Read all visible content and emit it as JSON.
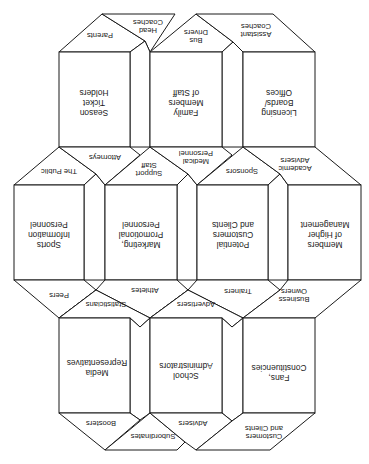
{
  "diagram": {
    "orientation": "rotated-180",
    "cubes": {
      "top_left": {
        "face": [
          "Season",
          "Ticket",
          "Holders"
        ],
        "roof": [
          "Parents"
        ],
        "roof_side": [
          "Head",
          "Coaches"
        ]
      },
      "top_middle": {
        "face": [
          "Family",
          "Members",
          "of Staff"
        ],
        "roof": [
          "Bus",
          "Drivers"
        ]
      },
      "top_right": {
        "face": [
          "Licensing",
          "Boards/",
          "Offices"
        ],
        "roof": [
          "Assistant",
          "Coaches"
        ]
      },
      "mid_1": {
        "face": [
          "Sports",
          "Information",
          "Personnel"
        ],
        "roof": [
          "The Public"
        ],
        "floor": [
          "Peers"
        ]
      },
      "mid_2": {
        "face": [
          "Marketing,",
          "Promotional",
          "Personnel"
        ],
        "roof": [
          "Support",
          "Staff"
        ],
        "roof_side": [
          "Attorneys"
        ],
        "floor": [
          "Athletes"
        ]
      },
      "mid_3": {
        "face": [
          "Potential",
          "Customers",
          "and Clients"
        ],
        "roof": [
          "Sponsors"
        ],
        "roof_side": [
          "Medical",
          "Personnel"
        ],
        "floor": [
          "Trainers"
        ]
      },
      "mid_4": {
        "face": [
          "Members",
          "of Higher",
          "Management"
        ],
        "roof": [
          "Academic",
          "Advisers"
        ],
        "floor": [
          "Business",
          "Owners"
        ]
      },
      "bottom_left": {
        "face": [
          "Media",
          "Representatives"
        ],
        "roof": [
          "Statisticians"
        ],
        "floor": [
          "Boosters"
        ],
        "floor_side": [
          "Subordinates"
        ]
      },
      "bottom_middle": {
        "face": [
          "School",
          "Administrators"
        ],
        "roof": [
          "Advertisers"
        ],
        "floor": [
          "Advisers"
        ]
      },
      "bottom_right": {
        "face": [
          "Fans,",
          "Constituencies"
        ],
        "floor": [
          "Customers",
          "and Clients"
        ]
      }
    }
  }
}
